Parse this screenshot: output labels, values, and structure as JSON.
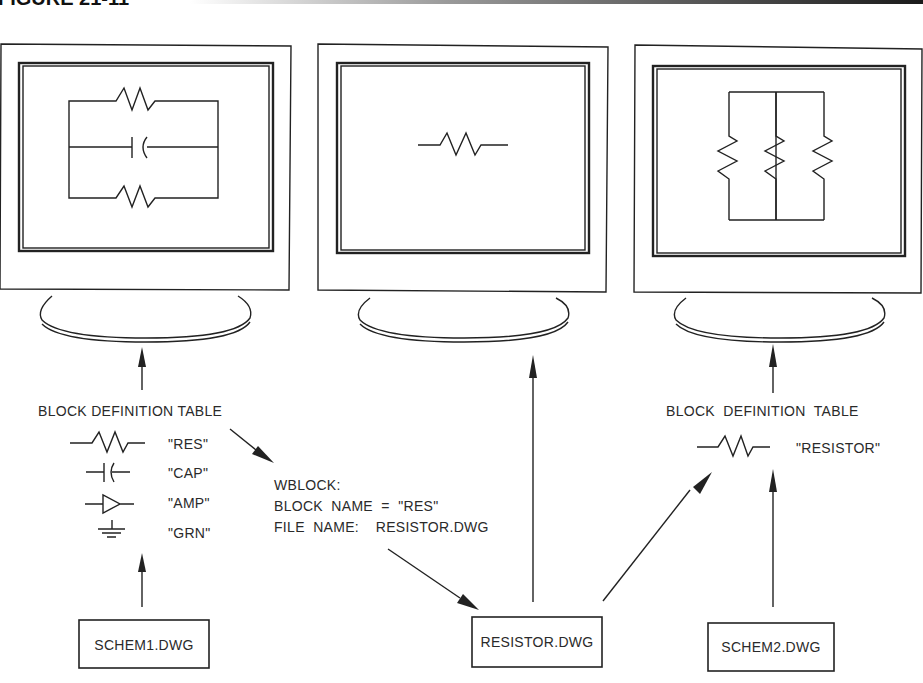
{
  "figure": {
    "header_label": "FIGURE 21-11",
    "header_bar_colors": [
      "#ffffff",
      "#222222"
    ]
  },
  "monitors": [
    {
      "name": "monitor-schem1",
      "screen_content": "parallel circuit: resistor, capacitor, resistor"
    },
    {
      "name": "monitor-resistor",
      "screen_content": "single resistor"
    },
    {
      "name": "monitor-schem2",
      "screen_content": "three resistors in parallel"
    }
  ],
  "left_table": {
    "title": "BLOCK DEFINITION TABLE",
    "entries": [
      {
        "symbol": "resistor",
        "name": "\"RES\""
      },
      {
        "symbol": "capacitor",
        "name": "\"CAP\""
      },
      {
        "symbol": "amplifier",
        "name": "\"AMP\""
      },
      {
        "symbol": "ground",
        "name": "\"GRN\""
      }
    ]
  },
  "wblock": {
    "line1": "WBLOCK:",
    "line2": "BLOCK  NAME  =  \"RES\"",
    "line3": "FILE  NAME:    RESISTOR.DWG"
  },
  "right_table": {
    "title": "BLOCK  DEFINITION  TABLE",
    "entries": [
      {
        "symbol": "resistor",
        "name": "\"RESISTOR\""
      }
    ]
  },
  "files": {
    "schem1": "SCHEM1.DWG",
    "resistor": "RESISTOR.DWG",
    "schem2": "SCHEM2.DWG"
  }
}
